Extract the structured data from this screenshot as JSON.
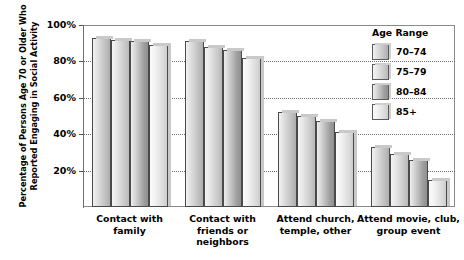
{
  "chart_data": {
    "type": "bar",
    "title": "",
    "xlabel": "",
    "ylabel": "Percentage of Persons Age 70 or Older Who Reported Engaging in Social Activity",
    "ylabel_line1": "Percentage of Persons Age 70 or Older Who",
    "ylabel_line2": "Reported Engaging in Social Activity",
    "ylim": [
      0,
      100
    ],
    "ytick_values": [
      100,
      80,
      60,
      40,
      20
    ],
    "ytick_labels": [
      "100%",
      "80%",
      "60%",
      "40%",
      "20%"
    ],
    "grid": "horizontal-dotted",
    "legend_position": "top-right",
    "legend_title": "Age Range",
    "categories": [
      "Contact with family",
      "Contact with friends or neighbors",
      "Attend church, temple, other",
      "Attend movie, club, group event"
    ],
    "category_lines": [
      [
        "Contact with",
        "family"
      ],
      [
        "Contact with",
        "friends or",
        "neighbors"
      ],
      [
        "Attend church,",
        "temple, other"
      ],
      [
        "Attend movie, club,",
        "group event"
      ]
    ],
    "series": [
      {
        "name": "70–74",
        "values": [
          93,
          91,
          52,
          33
        ]
      },
      {
        "name": "75–79",
        "values": [
          92,
          88,
          50,
          29
        ]
      },
      {
        "name": "80–84",
        "values": [
          91,
          86,
          47,
          26
        ]
      },
      {
        "name": "85+",
        "values": [
          89,
          82,
          41,
          15
        ]
      }
    ]
  },
  "colors": {
    "series_70_74": "#bdbdbd",
    "series_75_79": "#c6c6c6",
    "series_80_84": "#9d9d9d",
    "series_85_plus": "#dedede",
    "axis": "#6f6f6f",
    "grid": "#6d6d6d",
    "text": "#000000",
    "background": "#ffffff"
  }
}
